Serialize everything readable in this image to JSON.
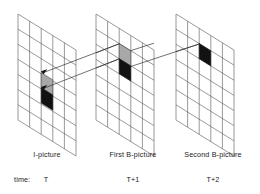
{
  "figure": {
    "type": "diagram",
    "background_color": "#ffffff",
    "grid_line_color": "#555555",
    "vector_line_color": "#333333"
  },
  "planes": [
    {
      "id": "plane-i-picture",
      "label": "I-picture",
      "time_label": "T",
      "columns": 5,
      "rows": 7,
      "blocks": [
        {
          "name": "gray-block",
          "color": "#a8a8a8",
          "col": 2,
          "row": 3
        },
        {
          "name": "black-block",
          "color": "#121212",
          "col": 2,
          "row": 4
        }
      ]
    },
    {
      "id": "plane-first-b-picture",
      "label": "First B-picture",
      "time_label": "T+1",
      "columns": 5,
      "rows": 7,
      "blocks": [
        {
          "name": "gray-block",
          "color": "#a8a8a8",
          "col": 2,
          "row": 2
        },
        {
          "name": "black-block",
          "color": "#121212",
          "col": 2,
          "row": 3
        }
      ]
    },
    {
      "id": "plane-second-b-picture",
      "label": "Second B-picture",
      "time_label": "T+2",
      "columns": 5,
      "rows": 7,
      "blocks": [
        {
          "name": "black-block",
          "color": "#121212",
          "col": 2,
          "row": 2
        }
      ]
    }
  ],
  "time_axis": {
    "label": "time:",
    "ticks": [
      "T",
      "T+1",
      "T+2"
    ]
  },
  "motion_vectors": [
    {
      "name": "gray-block-vector-t-to-t1",
      "from_plane": 0,
      "to_plane": 1,
      "block": "gray-block"
    },
    {
      "name": "black-block-vector-t-to-t1",
      "from_plane": 0,
      "to_plane": 1,
      "block": "black-block"
    },
    {
      "name": "black-block-vector-t1-to-t2",
      "from_plane": 1,
      "to_plane": 2,
      "block": "black-block"
    }
  ]
}
